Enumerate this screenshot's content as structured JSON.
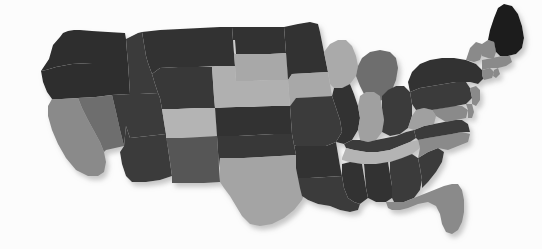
{
  "figure": {
    "kind": "choropleth-map",
    "region": "contiguous-united-states",
    "background_color": "#fcfcfc",
    "palette_type": "grayscale",
    "has_drop_shadow": true,
    "shadow_color": "#c9c9c9",
    "title": "",
    "legend": "",
    "axis_labels": ""
  },
  "chart_data": {
    "type": "map",
    "title": "",
    "xlabel": "",
    "ylabel": "",
    "grid": false,
    "legend_position": "none",
    "value_encoding": "grayscale-fill",
    "palette": {
      "darkest": "#1a1a1a",
      "very_dark": "#2e2e2e",
      "dark": "#3b3b3b",
      "mid_dark": "#565656",
      "mid": "#6e6e6e",
      "mid_light": "#8a8a8a",
      "light": "#a0a0a0",
      "lightest": "#b4b4b4"
    },
    "categories": [
      "Washington",
      "Oregon",
      "California",
      "Nevada",
      "Idaho",
      "Montana",
      "Wyoming",
      "Utah",
      "Arizona",
      "Colorado",
      "New Mexico",
      "North Dakota",
      "South Dakota",
      "Nebraska",
      "Kansas",
      "Oklahoma",
      "Texas",
      "Minnesota",
      "Iowa",
      "Missouri",
      "Arkansas",
      "Louisiana",
      "Wisconsin",
      "Illinois",
      "Michigan",
      "Indiana",
      "Ohio",
      "Kentucky",
      "Tennessee",
      "Mississippi",
      "Alabama",
      "Georgia",
      "Florida",
      "South Carolina",
      "North Carolina",
      "Virginia",
      "West Virginia",
      "Maryland",
      "Delaware",
      "Pennsylvania",
      "New Jersey",
      "New York",
      "Connecticut",
      "Rhode Island",
      "Massachusetts",
      "Vermont",
      "New Hampshire",
      "Maine"
    ],
    "values": [
      22,
      22,
      62,
      55,
      30,
      25,
      28,
      30,
      30,
      78,
      45,
      24,
      72,
      76,
      26,
      28,
      70,
      26,
      72,
      30,
      26,
      30,
      74,
      26,
      48,
      70,
      30,
      30,
      78,
      26,
      26,
      30,
      62,
      30,
      62,
      30,
      70,
      58,
      58,
      30,
      58,
      26,
      58,
      58,
      58,
      58,
      58,
      8
    ],
    "fills": [
      "#2e2e2e",
      "#2e2e2e",
      "#8a8a8a",
      "#6e6e6e",
      "#3b3b3b",
      "#333333",
      "#383838",
      "#3b3b3b",
      "#3b3b3b",
      "#b4b4b4",
      "#565656",
      "#303030",
      "#a8a8a8",
      "#b0b0b0",
      "#303030",
      "#383838",
      "#a4a4a4",
      "#323232",
      "#a8a8a8",
      "#3b3b3b",
      "#303030",
      "#3b3b3b",
      "#aaaaaa",
      "#303030",
      "#6e6e6e",
      "#a0a0a0",
      "#3b3b3b",
      "#3b3b3b",
      "#b4b4b4",
      "#303030",
      "#303030",
      "#3b3b3b",
      "#8a8a8a",
      "#3b3b3b",
      "#8a8a8a",
      "#3b3b3b",
      "#a0a0a0",
      "#8a8a8a",
      "#8a8a8a",
      "#3b3b3b",
      "#8a8a8a",
      "#303030",
      "#8a8a8a",
      "#8a8a8a",
      "#8a8a8a",
      "#8a8a8a",
      "#8a8a8a",
      "#1a1a1a"
    ]
  },
  "states": [
    {
      "name": "Washington",
      "abbr": "WA",
      "fill": "#2e2e2e",
      "value": 22,
      "d": "M41,71 L49,59 L53,45 L60,37 L63,33 L68,31 L74,30 L80,30 L92,31 L108,32 L125,33 L126,39 L127,52 L128,63 L110,63 L92,63 L72,64 L56,67 L46,70 Z"
    },
    {
      "name": "Oregon",
      "abbr": "OR",
      "fill": "#2e2e2e",
      "value": 22,
      "d": "M41,71 L46,70 L56,67 L72,64 L92,63 L110,63 L128,63 L129,78 L130,94 L112,95 L96,97 L78,98 L62,99 L52,99 L47,92 L43,82 Z"
    },
    {
      "name": "California",
      "abbr": "CA",
      "fill": "#8a8a8a",
      "value": 62,
      "d": "M52,99 L62,99 L78,98 L82,108 L88,120 L94,131 L100,142 L104,152 L106,162 L104,172 L98,176 L88,176 L76,170 L66,158 L58,144 L52,130 L48,116 L48,106 Z"
    },
    {
      "name": "Nevada",
      "abbr": "NV",
      "fill": "#6e6e6e",
      "value": 55,
      "d": "M78,98 L96,97 L112,95 L116,112 L120,130 L124,146 L106,150 L104,152 L100,142 L94,131 L88,120 L82,108 Z"
    },
    {
      "name": "Idaho",
      "abbr": "ID",
      "fill": "#3b3b3b",
      "value": 30,
      "d": "M126,39 L132,36 L138,33 L142,32 L144,44 L146,56 L148,63 L152,74 L155,84 L158,93 L140,94 L130,94 L129,78 L128,63 L127,52 Z"
    },
    {
      "name": "Montana",
      "abbr": "MT",
      "fill": "#333333",
      "value": 25,
      "d": "M142,32 L160,30 L180,29 L200,28 L220,27 L232,27 L233,40 L234,53 L235,66 L218,66 L198,67 L178,67 L160,68 L152,74 L148,63 L146,56 L144,44 Z"
    },
    {
      "name": "Wyoming",
      "abbr": "WY",
      "fill": "#383838",
      "value": 28,
      "d": "M160,68 L178,67 L198,67 L212,67 L213,82 L214,97 L215,108 L196,108 L178,109 L162,109 L160,98 L158,93 L155,84 L152,74 Z"
    },
    {
      "name": "Utah",
      "abbr": "UT",
      "fill": "#3b3b3b",
      "value": 30,
      "d": "M130,94 L140,94 L158,93 L160,98 L162,109 L164,122 L166,134 L148,136 L130,138 L126,126 L124,146 L120,130 L116,112 L112,95 Z"
    },
    {
      "name": "Arizona",
      "abbr": "AZ",
      "fill": "#3b3b3b",
      "value": 30,
      "d": "M124,146 L126,126 L130,138 L148,136 L166,134 L168,148 L170,162 L172,176 L160,180 L146,182 L132,182 L126,176 L122,164 L120,152 Z"
    },
    {
      "name": "Colorado",
      "abbr": "CO",
      "fill": "#b4b4b4",
      "value": 78,
      "d": "M162,109 L178,109 L196,108 L215,108 L216,122 L217,136 L200,137 L182,138 L166,138 L166,134 L164,122 Z"
    },
    {
      "name": "New Mexico",
      "abbr": "NM",
      "fill": "#565656",
      "value": 45,
      "d": "M166,138 L182,138 L200,137 L217,136 L218,152 L219,168 L220,182 L204,183 L188,183 L172,183 L172,176 L170,162 L168,148 Z"
    },
    {
      "name": "North Dakota",
      "abbr": "ND",
      "fill": "#303030",
      "value": 24,
      "d": "M232,27 L250,27 L268,27 L284,27 L285,40 L286,53 L270,54 L254,54 L236,54 L235,40 L233,40 Z"
    },
    {
      "name": "South Dakota",
      "abbr": "SD",
      "fill": "#a8a8a8",
      "value": 72,
      "d": "M235,54 L254,54 L270,54 L286,53 L287,66 L288,80 L270,80 L252,81 L236,81 L235,66 L234,53 Z"
    },
    {
      "name": "Nebraska",
      "abbr": "NE",
      "fill": "#b0b0b0",
      "value": 76,
      "d": "M212,67 L218,66 L235,66 L236,81 L252,81 L270,80 L288,80 L289,94 L290,106 L272,106 L254,107 L236,107 L220,108 L215,108 L214,97 L213,82 Z"
    },
    {
      "name": "Kansas",
      "abbr": "KS",
      "fill": "#303030",
      "value": 26,
      "d": "M215,108 L220,108 L236,107 L254,107 L272,106 L290,106 L291,120 L292,134 L274,134 L256,135 L238,136 L217,136 L216,122 Z"
    },
    {
      "name": "Oklahoma",
      "abbr": "OK",
      "fill": "#383838",
      "value": 28,
      "d": "M217,136 L238,136 L256,135 L274,134 L292,134 L294,145 L296,155 L280,156 L262,157 L244,158 L226,158 L220,158 L219,168 L218,152 Z"
    },
    {
      "name": "Texas",
      "abbr": "TX",
      "fill": "#a4a4a4",
      "value": 70,
      "d": "M220,182 L220,158 L226,158 L244,158 L262,157 L280,156 L296,155 L300,166 L304,178 L306,190 L302,200 L294,210 L284,218 L272,224 L260,226 L250,224 L242,216 L236,206 L230,196 L224,188 Z"
    },
    {
      "name": "Minnesota",
      "abbr": "MN",
      "fill": "#323232",
      "value": 26,
      "d": "M284,27 L298,24 L310,22 L318,24 L320,32 L322,42 L324,52 L326,62 L328,72 L310,73 L292,74 L288,80 L287,66 L286,53 L285,40 Z"
    },
    {
      "name": "Iowa",
      "abbr": "IA",
      "fill": "#a8a8a8",
      "value": 72,
      "d": "M288,80 L292,74 L310,73 L328,72 L330,84 L332,96 L314,97 L296,98 L290,106 L289,94 Z"
    },
    {
      "name": "Missouri",
      "abbr": "MO",
      "fill": "#3b3b3b",
      "value": 30,
      "d": "M290,106 L296,98 L314,97 L332,96 L336,108 L340,120 L342,132 L336,142 L326,146 L312,146 L296,146 L294,145 L292,134 L291,120 Z"
    },
    {
      "name": "Arkansas",
      "abbr": "AR",
      "fill": "#303030",
      "value": 26,
      "d": "M296,146 L312,146 L326,146 L336,142 L338,154 L340,166 L342,176 L326,177 L310,178 L298,178 L296,168 L296,155 L294,145 Z"
    },
    {
      "name": "Louisiana",
      "abbr": "LA",
      "fill": "#3b3b3b",
      "value": 30,
      "d": "M298,178 L310,178 L326,177 L342,176 L344,188 L348,198 L354,202 L360,204 L358,210 L350,212 L340,210 L330,206 L318,204 L308,200 L302,196 L300,188 Z"
    },
    {
      "name": "Wisconsin",
      "abbr": "WI",
      "fill": "#aaaaaa",
      "value": 74,
      "d": "M328,72 L326,62 L324,52 L330,44 L338,40 L346,40 L352,46 L356,56 L358,66 L356,76 L350,84 L342,88 L334,88 L330,84 Z"
    },
    {
      "name": "Illinois",
      "abbr": "IL",
      "fill": "#303030",
      "value": 26,
      "d": "M332,96 L334,88 L342,88 L350,84 L354,94 L358,106 L360,118 L358,130 L352,140 L344,144 L336,142 L342,132 L340,120 L336,108 Z"
    },
    {
      "name": "Michigan",
      "abbr": "MI",
      "fill": "#6e6e6e",
      "value": 48,
      "d": "M358,66 L362,58 L370,52 L380,50 L390,52 L396,58 L398,68 L396,80 L392,90 L386,98 L378,102 L370,100 L364,94 L360,86 L356,76 Z"
    },
    {
      "name": "Indiana",
      "abbr": "IN",
      "fill": "#a0a0a0",
      "value": 70,
      "d": "M358,106 L360,96 L366,92 L374,92 L380,96 L382,108 L384,120 L382,132 L376,140 L368,142 L360,140 L358,130 L360,118 Z"
    },
    {
      "name": "Ohio",
      "abbr": "OH",
      "fill": "#3b3b3b",
      "value": 30,
      "d": "M382,96 L388,90 L396,86 L404,86 L410,92 L412,104 L412,116 L408,128 L400,134 L390,136 L382,132 L384,120 L382,108 Z"
    },
    {
      "name": "Kentucky",
      "abbr": "KY",
      "fill": "#3b3b3b",
      "value": 30,
      "d": "M344,144 L352,140 L360,140 L368,142 L376,140 L386,138 L396,136 L406,132 L414,130 L416,138 L410,142 L400,146 L390,150 L378,152 L366,152 L354,150 L346,148 Z"
    },
    {
      "name": "Tennessee",
      "abbr": "TN",
      "fill": "#b4b4b4",
      "value": 78,
      "d": "M342,158 L346,148 L354,150 L366,152 L378,152 L390,150 L400,146 L410,142 L418,140 L420,148 L412,154 L402,158 L390,162 L376,164 L362,164 L350,162 L342,160 Z"
    },
    {
      "name": "Mississippi",
      "abbr": "MS",
      "fill": "#303030",
      "value": 26,
      "d": "M342,176 L342,164 L350,162 L362,164 L364,176 L366,188 L368,198 L360,204 L354,202 L348,198 L344,188 Z"
    },
    {
      "name": "Alabama",
      "abbr": "AL",
      "fill": "#303030",
      "value": 26,
      "d": "M364,164 L376,164 L388,162 L390,174 L392,186 L392,198 L386,202 L376,202 L368,198 L366,188 Z"
    },
    {
      "name": "Georgia",
      "abbr": "GA",
      "fill": "#3b3b3b",
      "value": 30,
      "d": "M390,162 L402,158 L412,154 L418,158 L420,168 L422,180 L420,190 L414,198 L404,202 L394,202 L392,198 L392,186 L390,174 Z"
    },
    {
      "name": "Florida",
      "abbr": "FL",
      "fill": "#8a8a8a",
      "value": 62,
      "d": "M386,202 L394,202 L404,202 L414,198 L424,194 L434,190 L444,186 L452,184 L458,184 L462,190 L464,200 L464,212 L462,222 L458,230 L452,234 L446,232 L442,224 L440,214 L436,206 L428,202 L418,204 L408,208 L400,210 L392,210 L388,208 Z"
    },
    {
      "name": "South Carolina",
      "abbr": "SC",
      "fill": "#3b3b3b",
      "value": 30,
      "d": "M418,158 L428,152 L438,148 L444,152 L442,162 L436,172 L428,182 L422,188 L422,180 L420,168 Z"
    },
    {
      "name": "North Carolina",
      "abbr": "NC",
      "fill": "#8a8a8a",
      "value": 62,
      "d": "M418,140 L428,138 L440,136 L452,134 L462,132 L470,134 L468,142 L458,146 L448,150 L438,148 L428,152 L418,158 L420,148 Z"
    },
    {
      "name": "Virginia",
      "abbr": "VA",
      "fill": "#3b3b3b",
      "value": 30,
      "d": "M414,130 L424,126 L434,124 L444,122 L454,120 L462,120 L468,124 L470,132 L462,132 L452,134 L440,136 L428,138 L418,140 L416,138 Z"
    },
    {
      "name": "West Virginia",
      "abbr": "WV",
      "fill": "#a0a0a0",
      "value": 70,
      "d": "M408,128 L412,116 L416,110 L424,108 L432,110 L436,116 L434,124 L424,126 L414,130 Z"
    },
    {
      "name": "Maryland",
      "abbr": "MD",
      "fill": "#8a8a8a",
      "value": 58,
      "d": "M432,110 L442,108 L452,106 L462,106 L468,110 L466,118 L456,120 L446,122 L436,116 Z"
    },
    {
      "name": "Delaware",
      "abbr": "DE",
      "fill": "#8a8a8a",
      "value": 58,
      "d": "M466,104 L472,104 L474,112 L472,118 L468,118 L468,110 Z"
    },
    {
      "name": "Pennsylvania",
      "abbr": "PA",
      "fill": "#3b3b3b",
      "value": 30,
      "d": "M410,92 L420,88 L432,86 L444,84 L456,82 L466,82 L470,88 L472,98 L466,104 L456,106 L444,108 L432,110 L424,108 L416,110 L412,104 Z"
    },
    {
      "name": "New Jersey",
      "abbr": "NJ",
      "fill": "#8a8a8a",
      "value": 58,
      "d": "M470,88 L476,86 L480,90 L480,100 L476,106 L472,104 L472,98 Z"
    },
    {
      "name": "New York",
      "abbr": "NY",
      "fill": "#303030",
      "value": 26,
      "d": "M410,92 L408,82 L412,72 L420,64 L430,60 L442,58 L454,58 L466,60 L476,64 L482,70 L484,78 L478,84 L470,82 L456,82 L444,84 L432,86 L420,88 Z"
    },
    {
      "name": "Connecticut",
      "abbr": "CT",
      "fill": "#8a8a8a",
      "value": 58,
      "d": "M482,70 L490,68 L494,72 L492,78 L484,80 L482,76 Z"
    },
    {
      "name": "Rhode Island",
      "abbr": "RI",
      "fill": "#8a8a8a",
      "value": 58,
      "d": "M494,70 L498,68 L500,74 L496,78 L493,76 Z"
    },
    {
      "name": "Massachusetts",
      "abbr": "MA",
      "fill": "#8a8a8a",
      "value": 58,
      "d": "M482,60 L492,58 L502,56 L510,56 L512,62 L506,66 L498,68 L490,68 L482,70 Z"
    },
    {
      "name": "Vermont",
      "abbr": "VT",
      "fill": "#8a8a8a",
      "value": 58,
      "d": "M466,60 L470,48 L476,42 L482,44 L482,54 L480,60 L474,62 Z"
    },
    {
      "name": "New Hampshire",
      "abbr": "NH",
      "fill": "#8a8a8a",
      "value": 58,
      "d": "M482,44 L488,40 L494,42 L496,52 L494,58 L488,58 L482,56 Z"
    },
    {
      "name": "Maine",
      "abbr": "ME",
      "fill": "#1a1a1a",
      "value": 8,
      "d": "M488,40 L490,30 L494,18 L498,8 L504,4 L512,6 L518,14 L522,26 L524,38 L522,48 L516,54 L508,56 L500,56 L496,52 L494,42 Z"
    }
  ]
}
